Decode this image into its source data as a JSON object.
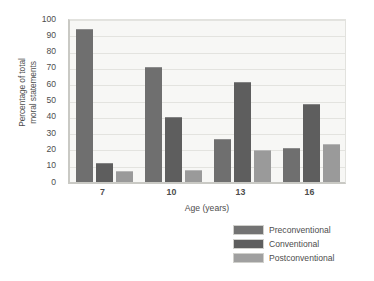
{
  "chart_data": {
    "type": "bar",
    "title": "",
    "subtitle": "",
    "xlabel": "Age (years)",
    "ylabel": "Percentage of total\nmoral statements",
    "categories": [
      "7",
      "10",
      "13",
      "16"
    ],
    "series": [
      {
        "name": "Preconventional",
        "color": "#6f6f6f",
        "values": [
          93,
          70,
          26,
          20
        ]
      },
      {
        "name": "Conventional",
        "color": "#5e5e5e",
        "values": [
          11,
          39,
          61,
          47
        ]
      },
      {
        "name": "Postconventional",
        "color": "#9a9a9a",
        "values": [
          6,
          7,
          19,
          23
        ]
      }
    ],
    "ylim": [
      0,
      100
    ],
    "yticks": [
      0,
      10,
      20,
      30,
      40,
      50,
      60,
      70,
      80,
      90,
      100
    ],
    "ytick_labels": [
      "0",
      "10",
      "20",
      "30",
      "40",
      "50",
      "60",
      "70",
      "80",
      "90",
      "100"
    ],
    "grid": true,
    "grid_axis": "y",
    "legend_position": "bottom-right",
    "plot_background": "#f7f7f5",
    "axis_color": "#c9c9c4",
    "text_color": "#4d4d4d"
  }
}
